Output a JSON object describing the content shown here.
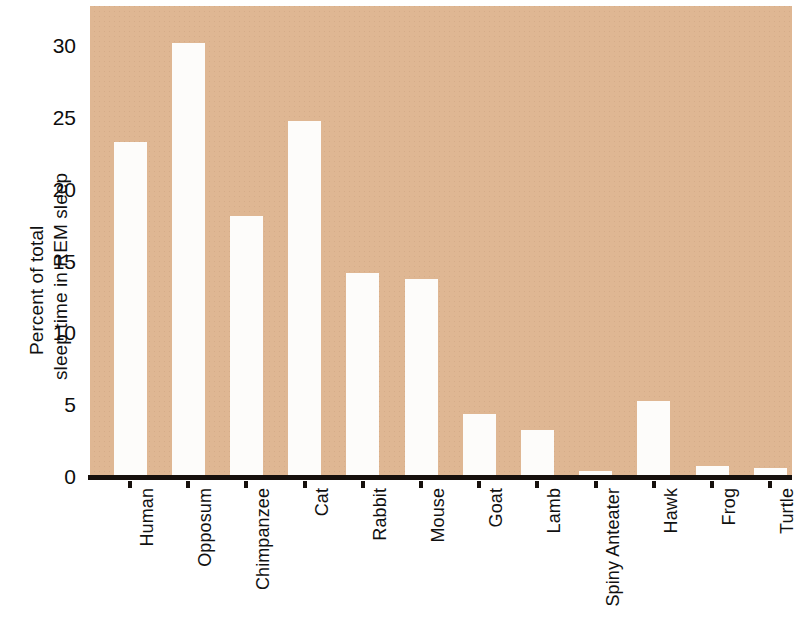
{
  "chart_data": {
    "type": "bar",
    "title": "",
    "subtitle": "",
    "xlabel": "",
    "ylabel": "Percent of total sleep time in REM sleep",
    "ylabel_lines": [
      "Percent of total",
      "sleep time in REM sleep"
    ],
    "categories": [
      "Human",
      "Opposum",
      "Chimpanzee",
      "Cat",
      "Rabbit",
      "Mouse",
      "Goat",
      "Lamb",
      "Spiny Anteater",
      "Hawk",
      "Frog",
      "Turtle"
    ],
    "values": [
      23.3,
      30.2,
      18.2,
      24.8,
      14.2,
      13.8,
      4.4,
      3.3,
      0.4,
      5.3,
      0.8,
      0.6
    ],
    "ylim": [
      0,
      32.8
    ],
    "yticks": [
      0,
      5,
      10,
      15,
      20,
      25,
      30
    ],
    "ytick_labels": [
      "0",
      "5",
      "10",
      "15",
      "20",
      "25",
      "30"
    ],
    "grid": false,
    "legend": false,
    "legend_position": "none",
    "bar_color": "#fdfcfa",
    "plot_background": "#dfb793",
    "axis_color": "#16100c",
    "text_color": "#111111"
  }
}
